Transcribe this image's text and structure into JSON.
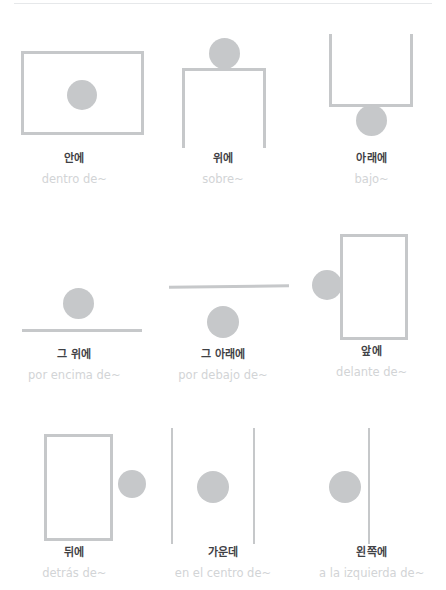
{
  "page": {
    "background_color": "#ffffff",
    "shape_color": "#c6c8ca",
    "korean_text_color": "#3f4145",
    "spanish_text_color": "#d2d4d6",
    "columns": 3,
    "rows": 3
  },
  "items": [
    {
      "id": "inside",
      "korean": "안에",
      "spanish": "dentro de~",
      "diagram": "circle-inside-rectangle"
    },
    {
      "id": "on-top",
      "korean": "위에",
      "spanish": "sobre~",
      "diagram": "circle-on-table-top"
    },
    {
      "id": "under",
      "korean": "아래에",
      "spanish": "bajo~",
      "diagram": "circle-under-container"
    },
    {
      "id": "above",
      "korean": "그 위에",
      "spanish": "por encima de~",
      "diagram": "circle-above-line"
    },
    {
      "id": "below",
      "korean": "그 아래에",
      "spanish": "por debajo de~",
      "diagram": "circle-below-line"
    },
    {
      "id": "in-front-of",
      "korean": "앞에",
      "spanish": "delante de~",
      "diagram": "circle-in-front-of-rectangle"
    },
    {
      "id": "behind",
      "korean": "뒤에",
      "spanish": "detrás de~",
      "diagram": "circle-behind-rectangle"
    },
    {
      "id": "in-the-middle",
      "korean": "가운데",
      "spanish": "en el centro de~",
      "diagram": "circle-between-two-lines"
    },
    {
      "id": "to-the-left",
      "korean": "왼쪽에",
      "spanish": "a la izquierda de~",
      "diagram": "circle-left-of-line"
    }
  ]
}
